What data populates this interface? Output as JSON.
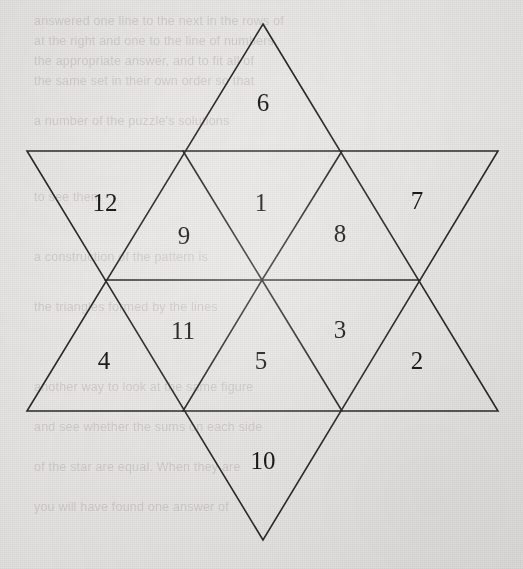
{
  "figure": {
    "name": "star-of-david-numbered-triangles",
    "type": "hexagram",
    "background_color": "#eceae8",
    "line_color": "#2b2b2b",
    "label_color": "#1b1b1b",
    "line_width": 1.6,
    "canvas": {
      "width": 523,
      "height": 569
    }
  },
  "chart_data": {
    "type": "diagram",
    "title": "",
    "shape": "star-of-david",
    "cell_count": 12,
    "labels": [
      "1",
      "2",
      "3",
      "4",
      "5",
      "6",
      "7",
      "8",
      "9",
      "10",
      "11",
      "12"
    ],
    "cells": [
      {
        "id": "cell-6",
        "label": "6",
        "x": 263,
        "y": 102,
        "region": "top-point",
        "orientation": "up"
      },
      {
        "id": "cell-12",
        "label": "12",
        "x": 105,
        "y": 202,
        "region": "upper-left-point",
        "orientation": "down"
      },
      {
        "id": "cell-1",
        "label": "1",
        "x": 261,
        "y": 202,
        "region": "inner-upper",
        "orientation": "down"
      },
      {
        "id": "cell-7",
        "label": "7",
        "x": 417,
        "y": 200,
        "region": "upper-right-point",
        "orientation": "down"
      },
      {
        "id": "cell-9",
        "label": "9",
        "x": 184,
        "y": 235,
        "region": "inner-upper-left",
        "orientation": "up"
      },
      {
        "id": "cell-8",
        "label": "8",
        "x": 340,
        "y": 233,
        "region": "inner-upper-right",
        "orientation": "up"
      },
      {
        "id": "cell-11",
        "label": "11",
        "x": 183,
        "y": 330,
        "region": "inner-lower-left",
        "orientation": "down"
      },
      {
        "id": "cell-3",
        "label": "3",
        "x": 340,
        "y": 329,
        "region": "inner-lower-right",
        "orientation": "down"
      },
      {
        "id": "cell-4",
        "label": "4",
        "x": 104,
        "y": 360,
        "region": "lower-left-point",
        "orientation": "up"
      },
      {
        "id": "cell-5",
        "label": "5",
        "x": 261,
        "y": 360,
        "region": "inner-lower",
        "orientation": "up"
      },
      {
        "id": "cell-2",
        "label": "2",
        "x": 417,
        "y": 360,
        "region": "lower-right-point",
        "orientation": "up"
      },
      {
        "id": "cell-10",
        "label": "10",
        "x": 263,
        "y": 460,
        "region": "bottom-point",
        "orientation": "down"
      }
    ],
    "geometry": {
      "upward_triangle": [
        [
          263,
          24
        ],
        [
          498,
          411
        ],
        [
          27,
          411
        ]
      ],
      "downward_triangle": [
        [
          263,
          540
        ],
        [
          27,
          151
        ],
        [
          498,
          151
        ]
      ],
      "hexagon": [
        [
          183,
          151
        ],
        [
          342,
          151
        ],
        [
          420,
          280
        ],
        [
          342,
          411
        ],
        [
          183,
          411
        ],
        [
          105,
          280
        ]
      ],
      "center": [
        262,
        280
      ],
      "inner_spokes": [
        [
          [
            262,
            280
          ],
          [
            183,
            151
          ]
        ],
        [
          [
            262,
            280
          ],
          [
            342,
            151
          ]
        ],
        [
          [
            262,
            280
          ],
          [
            420,
            280
          ]
        ],
        [
          [
            262,
            280
          ],
          [
            342,
            411
          ]
        ],
        [
          [
            262,
            280
          ],
          [
            183,
            411
          ]
        ],
        [
          [
            262,
            280
          ],
          [
            105,
            280
          ]
        ]
      ]
    }
  },
  "bleed_through_text": [
    {
      "x": 34,
      "y": 14,
      "text": "answered one line to the next in the rows of"
    },
    {
      "x": 34,
      "y": 34,
      "text": "at the right and one to the line of numbers"
    },
    {
      "x": 34,
      "y": 54,
      "text": "the appropriate answer, and to fit all of"
    },
    {
      "x": 34,
      "y": 74,
      "text": "the same set in their own order so that"
    },
    {
      "x": 34,
      "y": 114,
      "text": "a number of the puzzle's solutions"
    },
    {
      "x": 34,
      "y": 190,
      "text": "to see them"
    },
    {
      "x": 34,
      "y": 250,
      "text": "a construction of the pattern is"
    },
    {
      "x": 34,
      "y": 300,
      "text": "the triangles formed by the lines"
    },
    {
      "x": 34,
      "y": 380,
      "text": "another way to look at the same figure"
    },
    {
      "x": 34,
      "y": 420,
      "text": "and see whether the sums on each side"
    },
    {
      "x": 34,
      "y": 460,
      "text": "of the star are equal. When they are"
    },
    {
      "x": 34,
      "y": 500,
      "text": "you will have found one answer of"
    }
  ]
}
